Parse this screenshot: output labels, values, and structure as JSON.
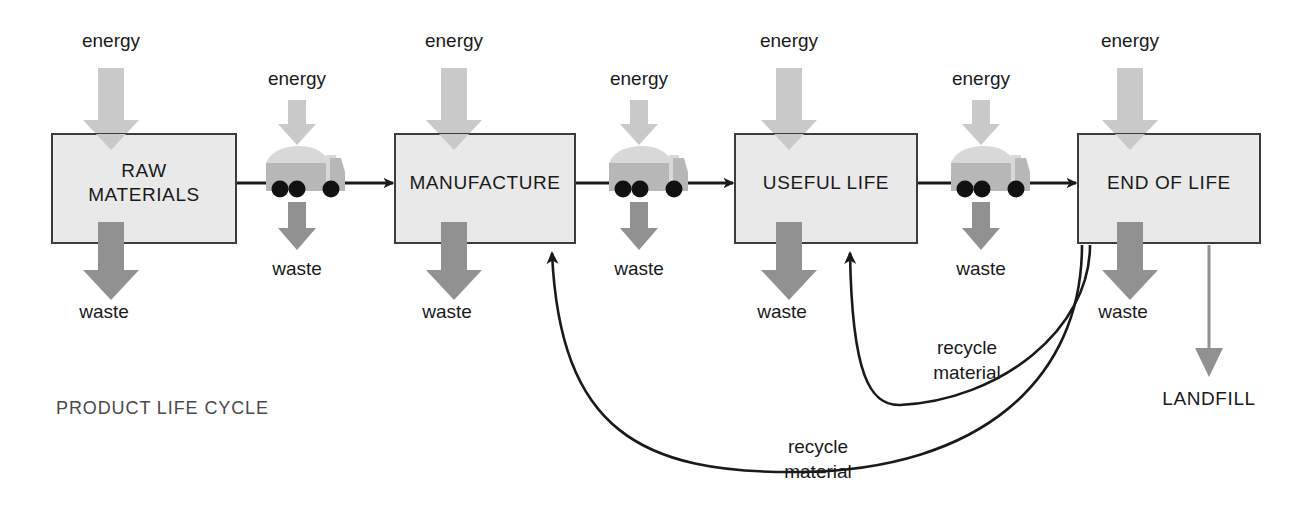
{
  "diagram": {
    "caption": "PRODUCT LIFE CYCLE",
    "colors": {
      "box_fill": "#e9e9e9",
      "box_stroke": "#3c3c3c",
      "energy_arrow": "#c9c9c9",
      "waste_arrow": "#919191",
      "landfill_arrow": "#919191",
      "flow_line": "#1a1a1a",
      "truck_body": "#b7b7b7",
      "truck_load": "#d8d8d8",
      "truck_wheel": "#111111",
      "text": "#1a1a1a",
      "caption_text": "#4a4a4a"
    },
    "stages": [
      {
        "id": "raw-materials",
        "label_lines": [
          "RAW",
          "MATERIALS"
        ],
        "x": 52,
        "y": 134,
        "w": 184,
        "h": 109
      },
      {
        "id": "manufacture",
        "label_lines": [
          "MANUFACTURE"
        ],
        "x": 395,
        "y": 134,
        "w": 180,
        "h": 109
      },
      {
        "id": "useful-life",
        "label_lines": [
          "USEFUL LIFE"
        ],
        "x": 735,
        "y": 134,
        "w": 182,
        "h": 109
      },
      {
        "id": "end-of-life",
        "label_lines": [
          "END OF LIFE"
        ],
        "x": 1078,
        "y": 134,
        "w": 182,
        "h": 109
      }
    ],
    "transports": [
      {
        "id": "transport-1",
        "cx": 302,
        "cy": 176
      },
      {
        "id": "transport-2",
        "cx": 645,
        "cy": 176
      },
      {
        "id": "transport-3",
        "cx": 987,
        "cy": 176
      }
    ],
    "energy_inputs": [
      {
        "id": "energy-raw-materials",
        "label": "energy",
        "size": "large",
        "cx": 111,
        "label_y": 42
      },
      {
        "id": "energy-transport-1",
        "label": "energy",
        "size": "small",
        "cx": 297,
        "label_y": 80
      },
      {
        "id": "energy-manufacture",
        "label": "energy",
        "size": "large",
        "cx": 454,
        "label_y": 42
      },
      {
        "id": "energy-transport-2",
        "label": "energy",
        "size": "small",
        "cx": 639,
        "label_y": 80
      },
      {
        "id": "energy-useful-life",
        "label": "energy",
        "size": "large",
        "cx": 789,
        "label_y": 42
      },
      {
        "id": "energy-transport-3",
        "label": "energy",
        "size": "small",
        "cx": 981,
        "label_y": 80
      },
      {
        "id": "energy-end-of-life",
        "label": "energy",
        "size": "large",
        "cx": 1130,
        "label_y": 42
      }
    ],
    "waste_outputs": [
      {
        "id": "waste-raw-materials",
        "label": "waste",
        "size": "large",
        "cx": 111,
        "label_y": 313
      },
      {
        "id": "waste-transport-1",
        "label": "waste",
        "size": "small",
        "cx": 297,
        "label_y": 270
      },
      {
        "id": "waste-manufacture",
        "label": "waste",
        "size": "large",
        "cx": 454,
        "label_y": 313
      },
      {
        "id": "waste-transport-2",
        "label": "waste",
        "size": "small",
        "cx": 639,
        "label_y": 270
      },
      {
        "id": "waste-useful-life",
        "label": "waste",
        "size": "large",
        "cx": 789,
        "label_y": 313
      },
      {
        "id": "waste-transport-3",
        "label": "waste",
        "size": "small",
        "cx": 981,
        "label_y": 270
      },
      {
        "id": "waste-end-of-life",
        "label": "waste",
        "size": "large",
        "cx": 1130,
        "label_y": 313
      }
    ],
    "recycle_flows": [
      {
        "id": "recycle-to-useful-life",
        "label_lines": [
          "recycle",
          "material"
        ],
        "label_x": 967,
        "label_y": 349,
        "from": "end-of-life",
        "to": "useful-life"
      },
      {
        "id": "recycle-to-manufacture",
        "label_lines": [
          "recycle",
          "material"
        ],
        "label_x": 818,
        "label_y": 448,
        "from": "end-of-life",
        "to": "manufacture"
      }
    ],
    "terminal": {
      "id": "landfill",
      "label": "LANDFILL",
      "x": 1209,
      "y": 400
    }
  }
}
